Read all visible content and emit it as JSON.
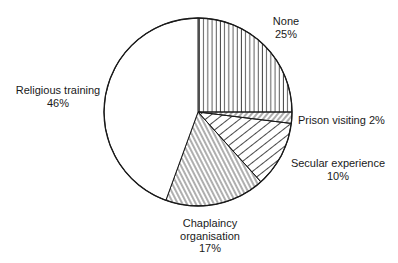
{
  "chart_data": {
    "type": "pie",
    "title": "",
    "slices": [
      {
        "label": "None",
        "value": 25,
        "pct_text": "25%",
        "pattern": "vertical",
        "start_deg": -90,
        "end_deg": 0
      },
      {
        "label": "Prison visiting",
        "value": 2,
        "pct_text": "2%",
        "pattern": "diag-dense",
        "start_deg": 0,
        "end_deg": 7
      },
      {
        "label": "Secular experience",
        "value": 10,
        "pct_text": "10%",
        "pattern": "diag-sparse",
        "start_deg": 7,
        "end_deg": 48
      },
      {
        "label": "Chaplaincy organisation",
        "value": 17,
        "pct_text": "17%",
        "pattern": "backdiag",
        "start_deg": 48,
        "end_deg": 110
      },
      {
        "label": "Religious training",
        "value": 46,
        "pct_text": "46%",
        "pattern": "none",
        "start_deg": 110,
        "end_deg": 270
      }
    ],
    "center": [
      198,
      112
    ],
    "radius": 94,
    "legend": "none (direct labels)"
  },
  "labels": {
    "none": {
      "line1": "None",
      "line2": "25%"
    },
    "prison": {
      "line1": "Prison visiting 2%"
    },
    "secular": {
      "line1": "Secular experience",
      "line2": "10%"
    },
    "chaplaincy": {
      "line1": "Chaplaincy",
      "line2": "organisation",
      "line3": "17%"
    },
    "religious": {
      "line1": "Religious training",
      "line2": "46%"
    }
  },
  "colors": {
    "stroke": "#1a1a1a",
    "fill": "#ffffff",
    "text": "#1a1a1a"
  }
}
